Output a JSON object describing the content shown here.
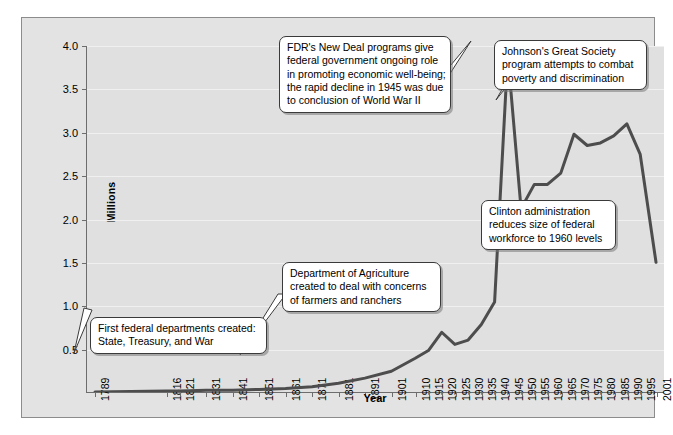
{
  "chart_data": {
    "type": "line",
    "title": "",
    "xlabel": "Year",
    "ylabel": "Millions",
    "ylim": [
      0.0,
      4.0
    ],
    "ytick_labels": [
      "4.0",
      "3.5",
      "3.0",
      "2.5",
      "2.0",
      "1.5",
      "1.0",
      "0.5"
    ],
    "ytick_values": [
      4.0,
      3.5,
      3.0,
      2.5,
      2.0,
      1.5,
      1.0,
      0.5
    ],
    "grid": true,
    "legend": "none",
    "categories": [
      "1789",
      "1816",
      "1821",
      "1831",
      "1841",
      "1851",
      "1861",
      "1871",
      "1881",
      "1891",
      "1901",
      "1910",
      "1915",
      "1920",
      "1925",
      "1930",
      "1935",
      "1940",
      "1945",
      "1950",
      "1955",
      "1960",
      "1965",
      "1970",
      "1975",
      "1980",
      "1985",
      "1990",
      "1995",
      "2001"
    ],
    "series": [
      {
        "name": "Federal civilian employment",
        "color": "#4d4d4d",
        "values": [
          0.0,
          0.01,
          0.01,
          0.02,
          0.02,
          0.03,
          0.04,
          0.06,
          0.1,
          0.16,
          0.24,
          0.39,
          0.48,
          0.69,
          0.55,
          0.6,
          0.78,
          1.04,
          3.9,
          2.12,
          2.4,
          2.4,
          2.53,
          2.98,
          2.85,
          2.88,
          2.96,
          3.1,
          2.75,
          1.5
        ]
      }
    ]
  },
  "annotations": [
    {
      "id": "first-departments",
      "lines": [
        "First federal departments created:",
        "State, Treasury, and War"
      ]
    },
    {
      "id": "dept-agriculture",
      "lines": [
        "Department of Agriculture",
        "created to deal with concerns",
        "of farmers and ranchers"
      ]
    },
    {
      "id": "new-deal",
      "lines": [
        "FDR's New Deal programs give",
        "federal government ongoing role",
        "in promoting economic well-being;",
        "the rapid decline in 1945 was due",
        "to conclusion of World War II"
      ]
    },
    {
      "id": "great-society",
      "lines": [
        "Johnson's Great Society",
        "program attempts to combat",
        "poverty and discrimination"
      ]
    },
    {
      "id": "clinton",
      "lines": [
        "Clinton administration",
        "reduces size of federal",
        "workforce to 1960 levels"
      ]
    }
  ]
}
